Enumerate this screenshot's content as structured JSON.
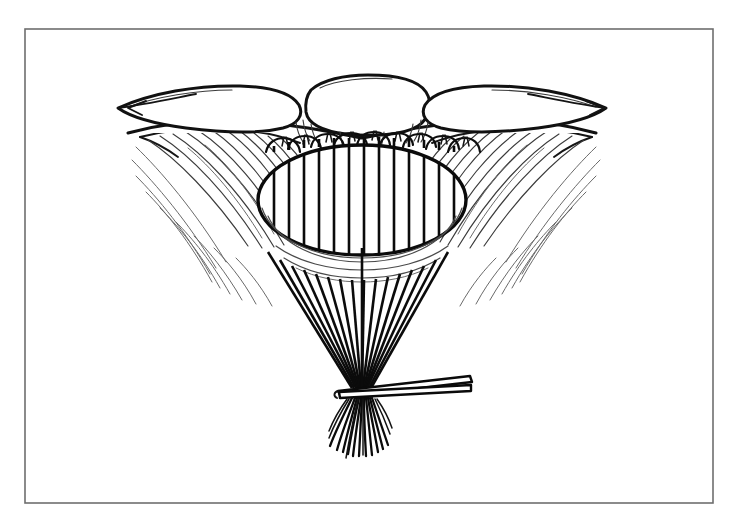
{
  "figure": {
    "caption": "Anatomic line illustration: three rounded lobes arch over an oval defect bridged by parallel vertical sutures; the suture ends converge downward into a bundle gripped by a clamp.",
    "medium": "black ink line art on white",
    "frame": {
      "name": "border-rectangle",
      "x": 25,
      "y": 29,
      "width": 688,
      "height": 474,
      "stroke_color": "#6e6e6e",
      "stroke_width": 1.6
    },
    "background_color": "#ffffff",
    "ink_color": "#111111",
    "fiber_color": "#3b3b3b"
  },
  "parts": {
    "lobes": {
      "name": "rounded-lobes",
      "count": 3,
      "labels": [
        "left-lobe",
        "center-lobe",
        "right-lobe"
      ],
      "description": "Three smooth rounded masses forming an arch along the upper margin"
    },
    "wings": {
      "name": "lateral-tissue-wings",
      "count": 2,
      "labels": [
        "left-wing",
        "right-wing"
      ],
      "description": "Tapering tissue flaps sweeping outward and downward from beneath the lobes, filled with fine parallel striation fibers"
    },
    "defect": {
      "name": "oval-defect",
      "shape": "ellipse",
      "center_x": 362,
      "center_y": 200,
      "radius_x": 104,
      "radius_y": 55,
      "description": "Central oval opening bridged by evenly spaced vertical sutures"
    },
    "bridging_sutures": {
      "name": "bridging-suture-set",
      "count": 13,
      "orientation": "vertical",
      "description": "Parallel vertical strands spanning the oval defect from upper rim to lower rim"
    },
    "top_loops": {
      "name": "suture-loop-arches",
      "count": 9,
      "description": "Small arch-shaped suture loops passing over the upper rim beneath the lobes"
    },
    "converging_bundle": {
      "name": "converging-suture-bundle",
      "count": 15,
      "description": "Suture limbs descending from the lower rim and converging to a single gathered point"
    },
    "clamp": {
      "name": "hemostat-clamp",
      "description": "Straight clamp jaw crossing the gathered suture bundle from the lower right",
      "tip_x": 340,
      "tip_y": 392,
      "handle_x": 470,
      "handle_y": 378
    },
    "free_tails": {
      "name": "free-suture-tails",
      "count": 17,
      "description": "Cut suture ends fanning out below the clamp"
    }
  },
  "chart_data": null
}
